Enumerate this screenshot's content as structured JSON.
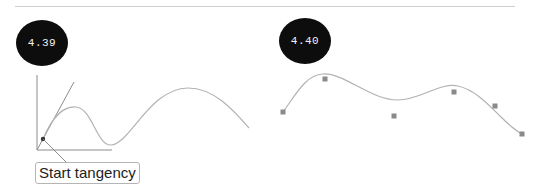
{
  "figures": [
    {
      "id": "left",
      "badge": "4.39",
      "callout": "Start tangency",
      "description": "Curve starting at origin with tangent line and start-point marker"
    },
    {
      "id": "right",
      "badge": "4.40",
      "description": "Smooth spline curve approximating six square control points",
      "control_points": [
        [
          283,
          112
        ],
        [
          325,
          79
        ],
        [
          394,
          116
        ],
        [
          454,
          92
        ],
        [
          495,
          106
        ],
        [
          522,
          134
        ]
      ]
    }
  ],
  "colors": {
    "badge_bg": "#0d0d0d",
    "badge_text": "#f2f2f2",
    "curve": "#b3b3b3",
    "axis": "#8c8c8c",
    "point": "#8a8a8a"
  }
}
